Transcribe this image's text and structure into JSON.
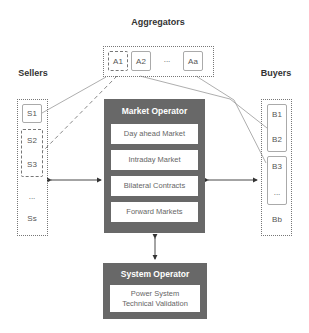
{
  "aggregators": {
    "title": "Aggregators",
    "items": [
      "A1",
      "A2",
      "...",
      "Aa"
    ]
  },
  "sellers": {
    "title": "Sellers",
    "items": [
      "S1",
      "S2",
      "S3",
      "...",
      "Ss"
    ]
  },
  "buyers": {
    "title": "Buyers",
    "items": [
      "B1",
      "B2",
      "B3",
      "...",
      "Bb"
    ]
  },
  "market_operator": {
    "title": "Market Operator",
    "markets": [
      "Day ahead Market",
      "Intraday Market",
      "Bilateral Contracts",
      "Forward Markets"
    ]
  },
  "system_operator": {
    "title": "System Operator",
    "function_line1": "Power System",
    "function_line2": "Technical Validation"
  },
  "colors": {
    "operator_fill": "#686868",
    "line": "#999999",
    "container_border": "#777777"
  }
}
